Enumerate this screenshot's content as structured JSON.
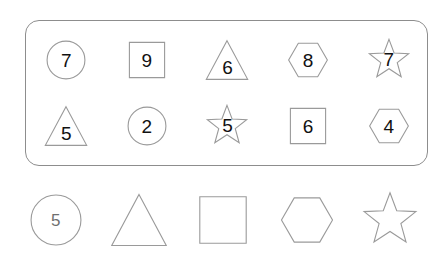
{
  "panel": {
    "rows": [
      {
        "cells": [
          {
            "shape": "circle",
            "value": "7"
          },
          {
            "shape": "square",
            "value": "9"
          },
          {
            "shape": "triangle",
            "value": "6"
          },
          {
            "shape": "hexagon",
            "value": "8"
          },
          {
            "shape": "star",
            "value": "7"
          }
        ]
      },
      {
        "cells": [
          {
            "shape": "triangle",
            "value": "5"
          },
          {
            "shape": "circle",
            "value": "2"
          },
          {
            "shape": "star",
            "value": "5"
          },
          {
            "shape": "square",
            "value": "6"
          },
          {
            "shape": "hexagon",
            "value": "4"
          }
        ]
      }
    ]
  },
  "legend": {
    "cells": [
      {
        "shape": "circle",
        "value": "5"
      },
      {
        "shape": "triangle",
        "value": ""
      },
      {
        "shape": "square",
        "value": ""
      },
      {
        "shape": "hexagon",
        "value": ""
      },
      {
        "shape": "star",
        "value": ""
      }
    ]
  },
  "colors": {
    "panel_border": "#8d8d8d",
    "shape_stroke": "#9a9a9a",
    "number_text": "#111111",
    "legend_number_text": "#6f6f6f",
    "background": "#ffffff"
  }
}
